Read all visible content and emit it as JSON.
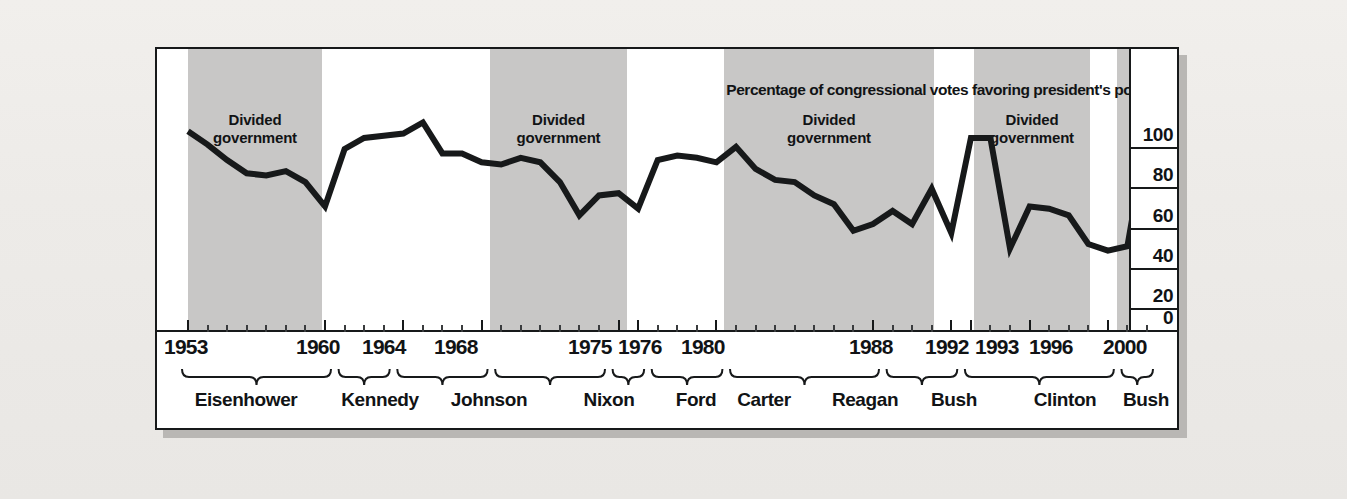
{
  "chart_data": {
    "type": "line",
    "title": "Percentage of congressional votes favoring president's position",
    "xlabel": "",
    "ylabel": "",
    "ylim": [
      0,
      100
    ],
    "yticks": [
      0,
      20,
      40,
      60,
      80,
      100
    ],
    "grid": true,
    "legend_position": "none",
    "x": [
      1953,
      1954,
      1955,
      1956,
      1957,
      1958,
      1959,
      1960,
      1961,
      1962,
      1963,
      1964,
      1965,
      1966,
      1967,
      1968,
      1969,
      1970,
      1971,
      1972,
      1973,
      1974,
      1975,
      1976,
      1977,
      1978,
      1979,
      1980,
      1981,
      1982,
      1983,
      1984,
      1985,
      1986,
      1987,
      1988,
      1989,
      1990,
      1991,
      1992,
      1993,
      1994,
      1995,
      1996,
      1997,
      1998,
      1999,
      2000,
      2001,
      2002
    ],
    "values": [
      89,
      83,
      76,
      70,
      69,
      71,
      66,
      55,
      81,
      86,
      87,
      88,
      93,
      79,
      79,
      75,
      74,
      77,
      75,
      66,
      51,
      60,
      61,
      54,
      76,
      78,
      77,
      75,
      82,
      72,
      67,
      66,
      60,
      56,
      44,
      47,
      53,
      47,
      63,
      43,
      86,
      86,
      36,
      55,
      54,
      51,
      38,
      35,
      37,
      88
    ],
    "series": [
      {
        "name": "Presidential success on congressional votes",
        "values": [
          89,
          83,
          76,
          70,
          69,
          71,
          66,
          55,
          81,
          86,
          87,
          88,
          93,
          79,
          79,
          75,
          74,
          77,
          75,
          66,
          51,
          60,
          61,
          54,
          76,
          78,
          77,
          75,
          82,
          72,
          67,
          66,
          60,
          56,
          44,
          47,
          53,
          47,
          63,
          43,
          86,
          86,
          36,
          55,
          54,
          51,
          38,
          35,
          37,
          88
        ]
      }
    ],
    "year_ticks": [
      "1953",
      "1960",
      "1964",
      "1968",
      "1975",
      "1976",
      "1980",
      "1988",
      "1992",
      "1993",
      "1996",
      "2000"
    ],
    "presidents": [
      {
        "name": "Eisenhower",
        "start": 1953,
        "end": 1960
      },
      {
        "name": "Kennedy",
        "start": 1961,
        "end": 1963
      },
      {
        "name": "Johnson",
        "start": 1964,
        "end": 1968
      },
      {
        "name": "Nixon",
        "start": 1969,
        "end": 1974
      },
      {
        "name": "Ford",
        "start": 1975,
        "end": 1976
      },
      {
        "name": "Carter",
        "start": 1977,
        "end": 1980
      },
      {
        "name": "Reagan",
        "start": 1981,
        "end": 1988
      },
      {
        "name": "Bush",
        "start": 1989,
        "end": 1992
      },
      {
        "name": "Clinton",
        "start": 1993,
        "end": 2000
      },
      {
        "name": "Bush",
        "start": 2001,
        "end": 2002
      }
    ],
    "divided_government": {
      "label_line1": "Divided",
      "label_line2": "government",
      "periods": [
        {
          "start": 1955,
          "end": 1960
        },
        {
          "start": 1969,
          "end": 1976
        },
        {
          "start": 1981,
          "end": 1992
        },
        {
          "start": 1995,
          "end": 2000
        },
        {
          "start": 2001.5,
          "end": 2002
        }
      ]
    },
    "colors": {
      "line": "#17191a",
      "band": "#c8c7c6",
      "background": "#ffffff",
      "axis": "#17191a",
      "text": "#111315"
    }
  }
}
